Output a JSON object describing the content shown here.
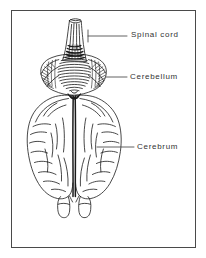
{
  "figure": {
    "type": "anatomical-line-drawing",
    "frame": {
      "border_color": "#4a4a4a",
      "background_color": "#ffffff"
    },
    "ink_color": "#1a1a1a",
    "label_color": "#333333"
  },
  "labels": [
    {
      "id": "spinal-cord",
      "text": "Spinal cord",
      "leader": {
        "x1": 88,
        "y1": 36,
        "x2": 127,
        "y2": 36
      },
      "tick": {
        "x": 88,
        "y1": 30,
        "y2": 42
      }
    },
    {
      "id": "cerebellum",
      "text": "Cerebellum",
      "leader": {
        "x1": 108,
        "y1": 77,
        "x2": 127,
        "y2": 77
      },
      "tick": null
    },
    {
      "id": "cerebrum",
      "text": "Cerebrum",
      "leader": {
        "x1": 97,
        "y1": 147,
        "x2": 134,
        "y2": 147
      },
      "tick": null
    }
  ],
  "structures": [
    {
      "id": "spinal-cord",
      "name": "Spinal cord (medulla)",
      "note": "vertical tapered tube with longitudinal striations, widening toward base"
    },
    {
      "id": "cerebellum",
      "name": "Cerebellum",
      "note": "transverse folia across midline vermis, hatched lateral hemispheres"
    },
    {
      "id": "cerebrum",
      "name": "Cerebrum",
      "note": "two hemispheres separated by deep longitudinal fissure, curved sulci"
    },
    {
      "id": "olfactory-bulbs",
      "name": "Olfactory bulbs",
      "note": "two small rounded lobes at the anterior (bottom) edge"
    }
  ]
}
